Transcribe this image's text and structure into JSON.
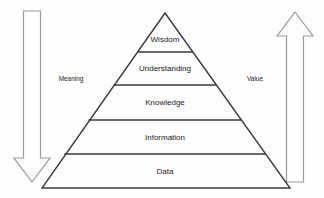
{
  "diagram": {
    "type": "pyramid-hierarchy",
    "background_color": "#fdfdfd",
    "outline_color": "#3a3a3a",
    "arrow_color": "#9a9a9a",
    "text_color": "#1c1c1c"
  },
  "tiers": [
    {
      "label": "Wisdom",
      "level": 5,
      "center_x": 165,
      "center_y": 40
    },
    {
      "label": "Understanding",
      "level": 4,
      "center_x": 165,
      "center_y": 69
    },
    {
      "label": "Knowledge",
      "level": 3,
      "center_x": 165,
      "center_y": 103
    },
    {
      "label": "Information",
      "level": 2,
      "center_x": 165,
      "center_y": 138
    },
    {
      "label": "Data",
      "level": 1,
      "center_x": 165,
      "center_y": 172
    }
  ],
  "arrows": [
    {
      "name": "meaning-arrow",
      "label": "Meaning",
      "direction": "down",
      "side": "left",
      "label_x": 71,
      "label_y": 79
    },
    {
      "name": "value-arrow",
      "label": "Value",
      "direction": "up",
      "side": "right",
      "label_x": 255,
      "label_y": 79
    }
  ],
  "geometry": {
    "apex_x": 165,
    "apex_y": 13,
    "base_y": 188,
    "base_left_x": 42,
    "base_right_x": 290,
    "divider_y": [
      52,
      85,
      120,
      154
    ]
  }
}
